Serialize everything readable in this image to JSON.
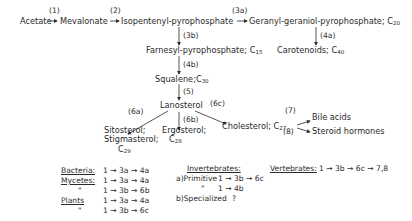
{
  "nodes": {
    "acetate": "Acetate",
    "mevalonate": "Mevalonate",
    "ipp": "Isopentenyl-pyrophosphate",
    "ggpp": "Geranyl-geraniol-pyrophosphate;",
    "ggpp_c": "C",
    "ggpp_sub": "20",
    "fpp": "Farnesyl-pyrophosphate;",
    "fpp_c": "C",
    "fpp_sub": "15",
    "carotenoids": "Carotenoids;",
    "carotenoids_c": "C",
    "carotenoids_sub": "40",
    "squalene": "Squalene;",
    "squalene_c": "C",
    "squalene_sub": "30",
    "lanosterol": "Lanosterol",
    "sitosterol1": "Sitosterol;",
    "sitosterol2": "Stigmasterol;",
    "sitosterol_c": "C",
    "sitosterol_sub": "29",
    "ergosterol": "Ergosterol;",
    "ergosterol_c": "C",
    "ergosterol_sub": "28",
    "cholesterol": "Cholesterol;",
    "cholesterol_c": "C",
    "cholesterol_sub": "27",
    "bile_acids": "Bile acids",
    "steroid_hormones": "Steroid hormones"
  },
  "steps": {
    "s1": "(1)",
    "s2": "(2)",
    "s3a": "(3a)",
    "s3b": "(3b)",
    "s4a": "(4a)",
    "s4b": "(4b)",
    "s5": "(5)",
    "s6a": "(6a)",
    "s6b": "(6b)",
    "s6c": "(6c)",
    "s7": "(7)",
    "s8": "(8)"
  },
  "legend": {
    "bacteria": {
      "label": "Bacteria:",
      "path": "1 → 3a → 4a"
    },
    "mycetes": {
      "label": "Mycetes:",
      "path": "1 → 3a → 4a"
    },
    "mycetes2": {
      "label": "\"",
      "path": "1 → 3b → 6b"
    },
    "plants": {
      "label": "Plants",
      "path": "1 → 3a → 4a"
    },
    "plants2": {
      "label": "\"",
      "path": "1 → 3b → 6c"
    },
    "invertebrates": {
      "label": "Invertebrates:"
    },
    "inv_a": {
      "label": "a)Primitive",
      "path": "1 → 3b → 6c"
    },
    "inv_a2": {
      "label": "\"",
      "path": "1 → 4b"
    },
    "inv_b": {
      "label": "b)Specialized",
      "path": "?"
    },
    "vertebrates": {
      "label": "Vertebrates:",
      "path": "1 → 3b → 6c → 7,8"
    }
  }
}
